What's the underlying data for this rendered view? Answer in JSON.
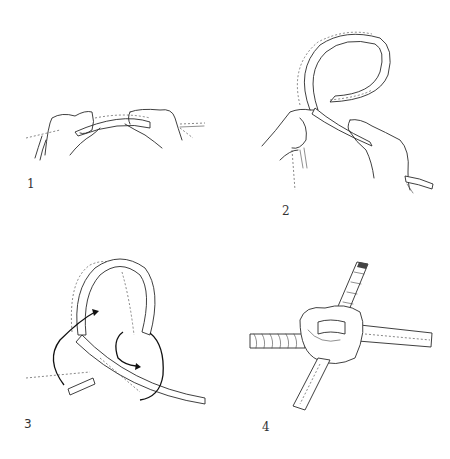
{
  "diagram": {
    "panels": [
      {
        "step": "1",
        "description": "two hands holding a rope horizontally"
      },
      {
        "step": "2",
        "description": "rope formed into an overhand loop held by two hands"
      },
      {
        "step": "3",
        "description": "loop with arrows showing the working end path"
      },
      {
        "step": "4",
        "description": "finished knot joining rope strands"
      }
    ]
  },
  "colors": {
    "background": "#ffffff",
    "ink": "#2a2a2a"
  }
}
